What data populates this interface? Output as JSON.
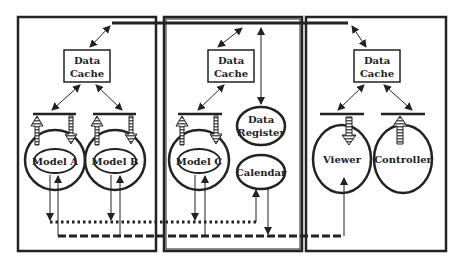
{
  "diagram": {
    "panels": [
      {
        "id": "left",
        "cache_label": [
          "Data",
          "Cache"
        ],
        "components": [
          {
            "label": "Model A",
            "type": "model"
          },
          {
            "label": "Model B",
            "type": "model"
          }
        ]
      },
      {
        "id": "middle",
        "cache_label": [
          "Data",
          "Cache"
        ],
        "components": [
          {
            "label": "Model C",
            "type": "model"
          },
          {
            "label_lines": [
              "Data",
              "Register"
            ],
            "type": "service"
          },
          {
            "label": "Calendar",
            "type": "service"
          }
        ]
      },
      {
        "id": "right",
        "cache_label": [
          "Data",
          "Cache"
        ],
        "components": [
          {
            "label": "Viewer",
            "type": "view"
          },
          {
            "label": "Controller",
            "type": "controller"
          }
        ]
      }
    ],
    "buses": {
      "dotted": "event bus (dotted)",
      "dashed": "update bus (dashed)"
    },
    "colors": {
      "stroke": "#222222",
      "background": "#ffffff"
    }
  }
}
